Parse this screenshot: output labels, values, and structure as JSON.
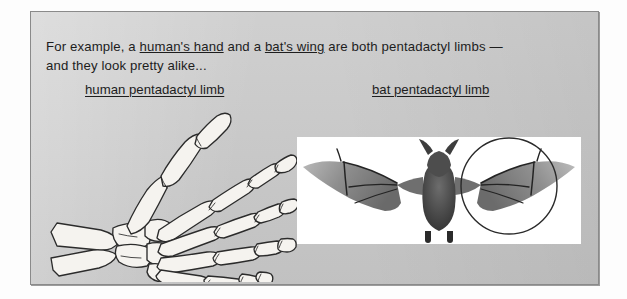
{
  "slide": {
    "background_color": "#c9c9c9",
    "border_color": "#8a8a8a",
    "text_color": "#1d1d1d"
  },
  "intro": {
    "part1": "For example, a ",
    "link1": "human's hand",
    "part2": " and a ",
    "link2": "bat's wing",
    "part3": " are both pentadactyl limbs —",
    "line2": "and they look pretty alike..."
  },
  "captions": {
    "human": "human pentadactyl limb",
    "bat": "bat pentadactyl limb"
  },
  "figures": {
    "hand": {
      "name": "human-hand-skeleton",
      "style": "line-art drawing",
      "digits": 5,
      "parts": [
        "radius",
        "ulna",
        "carpals",
        "metacarpals",
        "phalanges",
        "thumb"
      ],
      "outline_color": "#2a2a2a",
      "fill_color": "#f4f2ee"
    },
    "bat": {
      "name": "bat-in-flight-photograph",
      "style": "black and white photograph",
      "background_color": "#ffffff",
      "body_color": "#3a3a3a",
      "membrane_color": "#9a9a9a",
      "annotation": {
        "shape": "circle",
        "target": "right wing",
        "stroke_color": "#2a2a2a"
      }
    }
  }
}
